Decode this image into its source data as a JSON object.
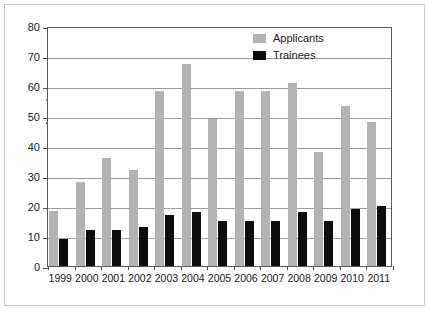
{
  "chart_data": {
    "type": "bar",
    "title": "",
    "xlabel": "",
    "ylabel": "Numbers",
    "ylim": [
      0,
      80
    ],
    "yticks": [
      0,
      10,
      20,
      30,
      40,
      50,
      60,
      70,
      80
    ],
    "grid": true,
    "legend_position": "top-right",
    "categories": [
      "1999",
      "2000",
      "2001",
      "2002",
      "2003",
      "2004",
      "2005",
      "2006",
      "2007",
      "2008",
      "2009",
      "2010",
      "2011"
    ],
    "series": [
      {
        "name": "Applicants",
        "color": "#b3b3b3",
        "values": [
          18.5,
          28,
          36,
          32,
          58.5,
          67.5,
          49,
          58.5,
          58.5,
          61,
          38,
          53.5,
          48
        ]
      },
      {
        "name": "Trainees",
        "color": "#0d0d0d",
        "values": [
          9,
          12,
          12,
          13,
          17,
          18,
          15,
          15,
          15,
          18,
          15,
          19,
          20
        ]
      }
    ]
  }
}
